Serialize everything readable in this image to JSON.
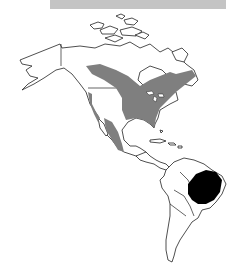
{
  "caption": {
    "text": "",
    "background": "#c4c4c4"
  },
  "map": {
    "title": "Species range map of the Americas",
    "regions": [
      {
        "name": "North America",
        "role": "landmass"
      },
      {
        "name": "Central America & Caribbean",
        "role": "landmass"
      },
      {
        "name": "South America",
        "role": "landmass"
      }
    ],
    "legend": [
      {
        "id": "breeding-range",
        "label": "Breeding range",
        "color": "#7f7f7f",
        "location": "Central Canada, eastern & central USA, western US coast, Mexico"
      },
      {
        "id": "wintering-range",
        "label": "Wintering range",
        "color": "#000000",
        "location": "Central/eastern Brazil"
      }
    ],
    "colors": {
      "land": "#ffffff",
      "outline": "#222222",
      "breeding": "#7f7f7f",
      "wintering": "#000000"
    }
  }
}
